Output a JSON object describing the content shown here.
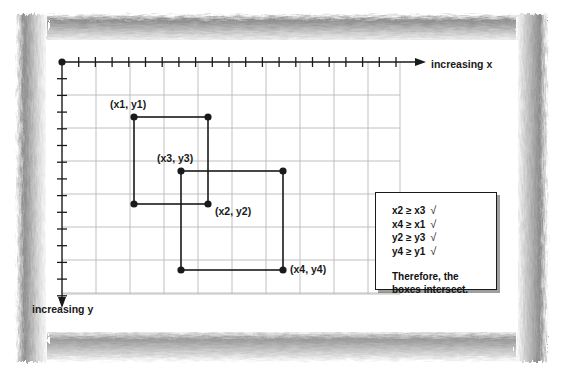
{
  "figure": {
    "type": "diagram",
    "axes": {
      "x_label": "increasing x",
      "y_label": "increasing y",
      "x_direction": "right",
      "y_direction": "down",
      "origin": [
        62,
        62
      ],
      "grid": {
        "visible": true,
        "color": "#b9b9b9",
        "cell_width": 34,
        "cell_height": 33,
        "left": 62,
        "top": 62,
        "right": 400,
        "bottom": 294,
        "tick_spacing": 16.7,
        "tick_color": "#1a1a1a"
      }
    },
    "boxes": [
      {
        "name": "box-1",
        "corner_labels": [
          "(x1, y1)",
          "(x2, y2)"
        ],
        "top_left": [
          134,
          117
        ],
        "bottom_right": [
          208,
          204
        ],
        "color": "#1a1a1a"
      },
      {
        "name": "box-2",
        "corner_labels": [
          "(x3, y3)",
          "(x4, y4)"
        ],
        "top_left": [
          181,
          171
        ],
        "bottom_right": [
          283,
          270
        ],
        "color": "#1a1a1a"
      }
    ],
    "points": [
      {
        "id": "p1",
        "label": "(x1, y1)",
        "x": 134,
        "y": 117
      },
      {
        "id": "p1b",
        "label": "",
        "x": 208,
        "y": 117
      },
      {
        "id": "p1c",
        "label": "",
        "x": 134,
        "y": 204
      },
      {
        "id": "p2",
        "label": "(x2, y2)",
        "x": 208,
        "y": 204
      },
      {
        "id": "p3",
        "label": "(x3, y3)",
        "x": 181,
        "y": 171
      },
      {
        "id": "p3b",
        "label": "",
        "x": 283,
        "y": 171
      },
      {
        "id": "p3c",
        "label": "",
        "x": 181,
        "y": 270
      },
      {
        "id": "p4",
        "label": "(x4, y4)",
        "x": 283,
        "y": 270
      }
    ]
  },
  "note_box": {
    "conditions": [
      {
        "text": "x2 ≥ x3",
        "mark": "√"
      },
      {
        "text": "x4 ≥ x1",
        "mark": "√"
      },
      {
        "text": "y2 ≥ y3",
        "mark": "√"
      },
      {
        "text": "y4 ≥ y1",
        "mark": "√"
      }
    ],
    "conclusion_line_1": "Therefore, the",
    "conclusion_line_2": "boxes intersect."
  },
  "colors": {
    "ink": "#1a1a1a",
    "grid": "#b9b9b9",
    "frame": "#9a9a9a",
    "paper": "#ffffff"
  }
}
